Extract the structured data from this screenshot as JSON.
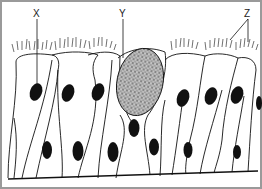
{
  "diagram": {
    "labels": [
      {
        "id": "X",
        "text": "X",
        "points_to": "nucleus of ciliated columnar cell"
      },
      {
        "id": "Y",
        "text": "Y",
        "points_to": "goblet cell"
      },
      {
        "id": "Z",
        "text": "Z",
        "points_to": "cilia"
      }
    ],
    "colors": {
      "line": "#111111",
      "border": "#9a9a9a",
      "background": "#ffffff"
    }
  }
}
